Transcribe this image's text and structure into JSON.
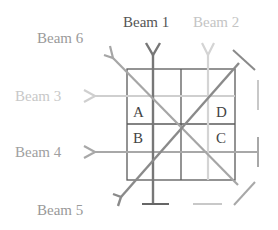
{
  "diagram": {
    "beams": [
      {
        "id": "beam-1",
        "label": "Beam 1",
        "color": "#6e6e6e"
      },
      {
        "id": "beam-2",
        "label": "Beam 2",
        "color": "#c8c8c8"
      },
      {
        "id": "beam-3",
        "label": "Beam 3",
        "color": "#c8c8c8"
      },
      {
        "id": "beam-4",
        "label": "Beam 4",
        "color": "#9a9a9a"
      },
      {
        "id": "beam-5",
        "label": "Beam 5",
        "color": "#8a8a8a"
      },
      {
        "id": "beam-6",
        "label": "Beam 6",
        "color": "#a0a0a0"
      }
    ],
    "cells": {
      "a": "A",
      "b": "B",
      "c": "C",
      "d": "D"
    },
    "grid_color": "#555555"
  }
}
